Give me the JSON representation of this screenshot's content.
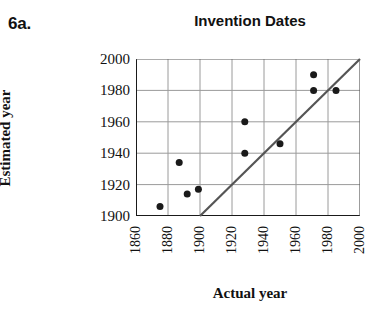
{
  "problem": {
    "label": "6a."
  },
  "chart_data": {
    "type": "scatter",
    "title": "Invention Dates",
    "xlabel": "Actual year",
    "ylabel": "Estimated year",
    "xlim": [
      1860,
      2000
    ],
    "ylim": [
      1900,
      2000
    ],
    "xticks": [
      1860,
      1880,
      1900,
      1920,
      1940,
      1960,
      1980,
      2000
    ],
    "yticks": [
      1900,
      1920,
      1940,
      1960,
      1980,
      2000
    ],
    "xtick_labels": [
      "1860",
      "1880",
      "1900",
      "1920",
      "1940",
      "1960",
      "1980",
      "2000"
    ],
    "ytick_labels": [
      "1900",
      "1920",
      "1940",
      "1960",
      "1980",
      "2000"
    ],
    "grid": true,
    "legend": null,
    "marker": {
      "shape": "circle",
      "color": "#1a1a1a",
      "size": 7
    },
    "points": [
      {
        "x": 1875,
        "y": 1906
      },
      {
        "x": 1887,
        "y": 1934
      },
      {
        "x": 1892,
        "y": 1914
      },
      {
        "x": 1899,
        "y": 1917
      },
      {
        "x": 1928,
        "y": 1960
      },
      {
        "x": 1928,
        "y": 1940
      },
      {
        "x": 1950,
        "y": 1946
      },
      {
        "x": 1971,
        "y": 1990
      },
      {
        "x": 1971,
        "y": 1980
      },
      {
        "x": 1985,
        "y": 1980
      }
    ],
    "reference_line": {
      "name": "identity-line",
      "from": {
        "x": 1900,
        "y": 1900
      },
      "to": {
        "x": 2000,
        "y": 2000
      },
      "color": "#555555",
      "width": 2
    },
    "colors": {
      "axis": "#1a1a1a",
      "grid": "#9a9a9a",
      "marker": "#1a1a1a",
      "reference_line": "#555555",
      "background": "#ffffff"
    }
  }
}
